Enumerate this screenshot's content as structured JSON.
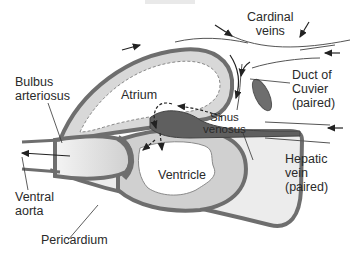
{
  "diagram": {
    "type": "anatomical-illustration",
    "labels": {
      "cardinal_veins": [
        "Cardinal",
        "veins"
      ],
      "bulbus_arteriosus": [
        "Bulbus",
        "arteriosus"
      ],
      "atrium": "Atrium",
      "duct_of_cuvier": [
        "Duct of",
        "Cuvier",
        "(paired)"
      ],
      "sinus_venosus": [
        "Sinus",
        "venosus"
      ],
      "hepatic_vein": [
        "Hepatic",
        "vein",
        "(paired)"
      ],
      "ventricle": "Ventricle",
      "ventral_aorta": [
        "Ventral",
        "aorta"
      ],
      "pericardium": "Pericardium"
    },
    "colors": {
      "wall_dark": "#6e6e6e",
      "tissue_light": "#d4d4d4",
      "tissue_pale": "#eaeaea",
      "sinus_dark": "#5f5f5f",
      "line": "#333333",
      "background": "#ffffff"
    },
    "flow": {
      "solid_arrows": "venous inflow via cardinal veins, duct of Cuvier, hepatic vein",
      "dashed_arrows": "blood path sinus venosus → atrium → ventricle → bulbus → ventral aorta"
    }
  }
}
